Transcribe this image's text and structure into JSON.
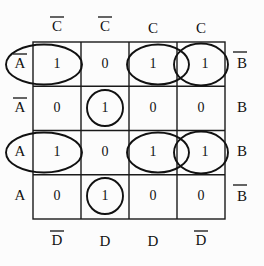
{
  "diagram": {
    "kind": "karnaugh-map",
    "title": "",
    "grid": {
      "rows": 4,
      "cols": 4
    },
    "labels": {
      "top": [
        {
          "var": "C",
          "overbar": true,
          "text": "C"
        },
        {
          "var": "C",
          "overbar": true,
          "text": "C"
        },
        {
          "var": "C",
          "overbar": false,
          "text": "C"
        },
        {
          "var": "C",
          "overbar": false,
          "text": "C"
        }
      ],
      "bottom": [
        {
          "var": "D",
          "overbar": true,
          "text": "D"
        },
        {
          "var": "D",
          "overbar": false,
          "text": "D"
        },
        {
          "var": "D",
          "overbar": false,
          "text": "D"
        },
        {
          "var": "D",
          "overbar": true,
          "text": "D"
        }
      ],
      "left": [
        {
          "var": "A",
          "overbar": true,
          "text": "A"
        },
        {
          "var": "A",
          "overbar": true,
          "text": "A"
        },
        {
          "var": "A",
          "overbar": false,
          "text": "A"
        },
        {
          "var": "A",
          "overbar": false,
          "text": "A"
        }
      ],
      "right": [
        {
          "var": "B",
          "overbar": true,
          "text": "B"
        },
        {
          "var": "B",
          "overbar": false,
          "text": "B"
        },
        {
          "var": "B",
          "overbar": false,
          "text": "B"
        },
        {
          "var": "B",
          "overbar": true,
          "text": "B"
        }
      ]
    },
    "cells": [
      [
        "1",
        "0",
        "1",
        "1"
      ],
      [
        "0",
        "1",
        "0",
        "0"
      ],
      [
        "1",
        "0",
        "1",
        "1"
      ],
      [
        "0",
        "1",
        "0",
        "0"
      ]
    ],
    "groups": [
      {
        "name": "row1-col1-wrap-ellipse",
        "row": 1,
        "cols": [
          1
        ],
        "shape": "ellipse",
        "wraps": true
      },
      {
        "name": "row1-col3-ellipse",
        "row": 1,
        "cols": [
          3
        ],
        "shape": "ellipse",
        "wraps": false
      },
      {
        "name": "row1-col4-ellipse",
        "row": 1,
        "cols": [
          4
        ],
        "shape": "ellipse",
        "wraps": true
      },
      {
        "name": "row2-col2-circle",
        "row": 2,
        "cols": [
          2
        ],
        "shape": "circle",
        "wraps": false
      },
      {
        "name": "row3-col1-wrap-ellipse",
        "row": 3,
        "cols": [
          1
        ],
        "shape": "ellipse",
        "wraps": true
      },
      {
        "name": "row3-col3-ellipse",
        "row": 3,
        "cols": [
          3
        ],
        "shape": "ellipse",
        "wraps": false
      },
      {
        "name": "row3-col4-ellipse",
        "row": 3,
        "cols": [
          4
        ],
        "shape": "ellipse",
        "wraps": true
      },
      {
        "name": "row4-col2-circle",
        "row": 4,
        "cols": [
          2
        ],
        "shape": "circle",
        "wraps": false
      }
    ],
    "colors": {
      "ink": "#111111",
      "grid": "#1a1a1a",
      "background": "#fcfcfc"
    }
  }
}
